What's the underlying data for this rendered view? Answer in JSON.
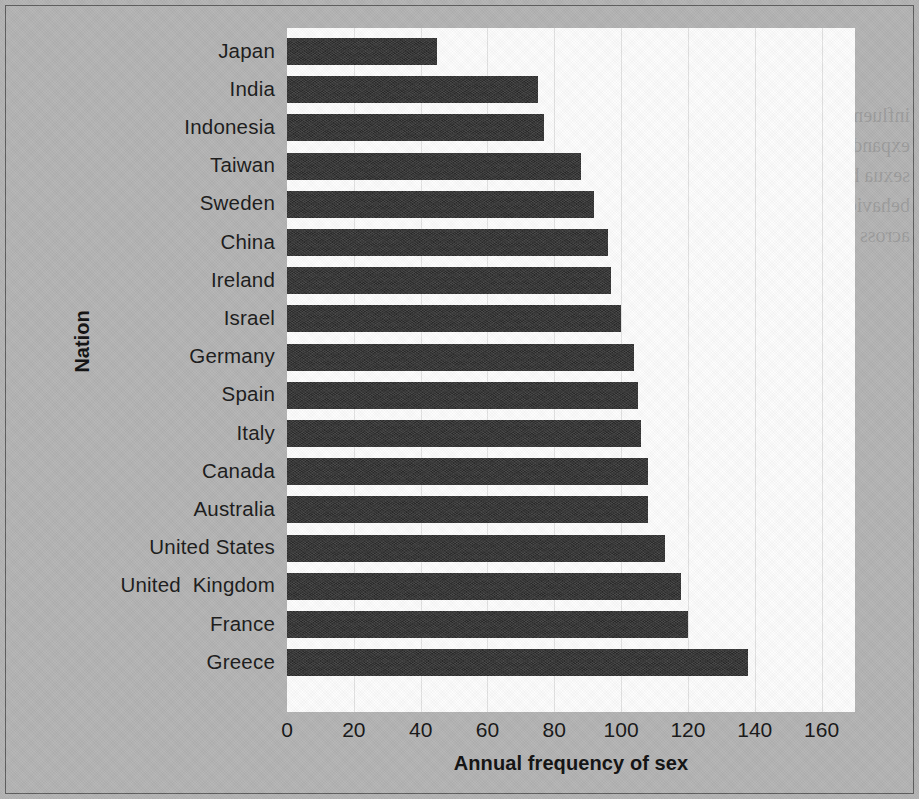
{
  "chart_data": {
    "type": "bar",
    "orientation": "horizontal",
    "title": "",
    "xlabel": "Annual frequency of sex",
    "ylabel": "Nation",
    "categories": [
      "Japan",
      "India",
      "Indonesia",
      "Taiwan",
      "Sweden",
      "China",
      "Ireland",
      "Israel",
      "Germany",
      "Spain",
      "Italy",
      "Canada",
      "Australia",
      "United States",
      "United  Kingdom",
      "France",
      "Greece"
    ],
    "values": [
      45,
      75,
      77,
      88,
      92,
      96,
      97,
      100,
      104,
      105,
      106,
      108,
      108,
      113,
      118,
      120,
      138
    ],
    "xlim": [
      0,
      170
    ],
    "xticks": [
      0,
      20,
      40,
      60,
      80,
      100,
      120,
      140,
      160
    ],
    "xtick_labels": [
      "0",
      "20",
      "40",
      "60",
      "80",
      "100",
      "120",
      "140",
      "160"
    ],
    "grid": true,
    "legend": "none",
    "bar_color": "#2e2e2e",
    "plot_background": "#fdfdfd",
    "figure_background": "#b4b4b4"
  },
  "bleed_through_text": "influence\nKatigbak, 1995\ntransaction (sever\nexpands it the\npires.\" Some ind\nthat promote sexua\nhas been widely\nare suppressed\nsexuality\nbehavior\nare substantially\nvary considerably\nacross cultures"
}
